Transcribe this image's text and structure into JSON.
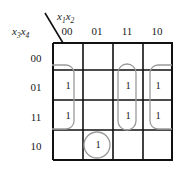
{
  "headers": {
    "column_variables": "x1x2",
    "column_variables_display": "x₁x₂",
    "row_variables": "x3x4",
    "row_variables_display": "x₃x₄",
    "column_labels": [
      "00",
      "01",
      "11",
      "10"
    ],
    "row_labels": [
      "00",
      "01",
      "11",
      "10"
    ]
  },
  "cells": [
    [
      "",
      "",
      "",
      ""
    ],
    [
      "1",
      "",
      "1",
      "1"
    ],
    [
      "1",
      "",
      "1",
      "1"
    ],
    [
      "",
      "1",
      "",
      ""
    ]
  ],
  "groups": [
    {
      "name": "group-left-wrap",
      "shape": "rounded-rect",
      "cells": [
        "row01-col00",
        "row11-col00"
      ],
      "open_edge": "left"
    },
    {
      "name": "group-col11",
      "shape": "rounded-rect",
      "cells": [
        "row01-col11",
        "row11-col11"
      ],
      "open_edge": "none"
    },
    {
      "name": "group-right-wrap",
      "shape": "rounded-rect",
      "cells": [
        "row01-col10",
        "row11-col10"
      ],
      "open_edge": "right"
    },
    {
      "name": "group-single",
      "shape": "circle",
      "cells": [
        "row10-col01"
      ],
      "open_edge": "none"
    }
  ],
  "colors": {
    "grid_line": "#111111",
    "group_outline": "#9a9a9a",
    "text": "#1a1a1a",
    "background": "#ffffff"
  }
}
